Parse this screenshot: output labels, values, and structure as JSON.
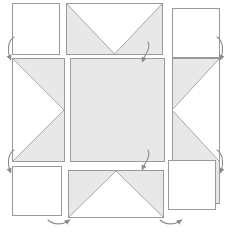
{
  "diagram": {
    "type": "star-quilt-block-layout",
    "canvas": {
      "width": 231,
      "height": 233
    },
    "colors": {
      "fabric_fill": "#e8e8e8",
      "background": "#ffffff",
      "outline": "#9a9a9a",
      "diagonal_seam": "#a8a8a8",
      "arrow": "#8c8c8c"
    },
    "grid": {
      "columns": 3,
      "rows": 3,
      "column_x": [
        12,
        78,
        172
      ],
      "row_y": [
        3,
        58,
        170
      ]
    },
    "blocks": [
      {
        "name": "block-top-left",
        "role": "corner-square",
        "pattern": "plain",
        "fill": "white",
        "x": 12,
        "y": 3,
        "w": 48,
        "h": 52
      },
      {
        "name": "block-top-center",
        "role": "flying-geese-top",
        "pattern": "v-notch-down",
        "fill": "gray",
        "x": 66,
        "y": 3,
        "w": 97,
        "h": 52
      },
      {
        "name": "block-top-right",
        "role": "corner-square",
        "pattern": "plain",
        "fill": "white",
        "x": 172,
        "y": 8,
        "w": 48,
        "h": 50
      },
      {
        "name": "block-middle-left",
        "role": "flying-geese-left",
        "pattern": "triangle-point-right",
        "fill": "gray",
        "x": 12,
        "y": 58,
        "w": 53,
        "h": 104
      },
      {
        "name": "block-center",
        "role": "center-square",
        "pattern": "solid",
        "fill": "gray",
        "x": 70,
        "y": 58,
        "w": 95,
        "h": 104
      },
      {
        "name": "block-middle-right",
        "role": "flying-geese-right",
        "pattern": "triangle-point-left",
        "fill": "gray",
        "x": 172,
        "y": 58,
        "w": 48,
        "h": 146
      },
      {
        "name": "block-bottom-left",
        "role": "corner-square",
        "pattern": "plain",
        "fill": "white",
        "x": 12,
        "y": 166,
        "w": 50,
        "h": 50
      },
      {
        "name": "block-bottom-center",
        "role": "flying-geese-bottom",
        "pattern": "triangle-point-up",
        "fill": "gray",
        "x": 68,
        "y": 170,
        "w": 96,
        "h": 48
      },
      {
        "name": "block-bottom-right",
        "role": "corner-square",
        "pattern": "plain",
        "fill": "white",
        "x": 168,
        "y": 160,
        "w": 48,
        "h": 50
      }
    ],
    "arrows": [
      {
        "name": "arrow-left-upper",
        "direction": "down",
        "curve": "left-hook",
        "x": 10,
        "y": 38
      },
      {
        "name": "arrow-left-lower",
        "direction": "down",
        "curve": "left-hook",
        "x": 10,
        "y": 150
      },
      {
        "name": "arrow-right-upper",
        "direction": "down",
        "curve": "right-hook",
        "x": 215,
        "y": 38
      },
      {
        "name": "arrow-right-lower",
        "direction": "down",
        "curve": "right-hook",
        "x": 215,
        "y": 150
      },
      {
        "name": "arrow-center-upper",
        "direction": "down",
        "curve": "right-hook",
        "x": 143,
        "y": 44
      },
      {
        "name": "arrow-center-lower",
        "direction": "down",
        "curve": "right-hook",
        "x": 143,
        "y": 152
      },
      {
        "name": "arrow-bottom-left",
        "direction": "right",
        "curve": "under-sweep",
        "x": 56,
        "y": 214
      },
      {
        "name": "arrow-bottom-right",
        "direction": "right",
        "curve": "under-sweep",
        "x": 168,
        "y": 214
      }
    ]
  }
}
